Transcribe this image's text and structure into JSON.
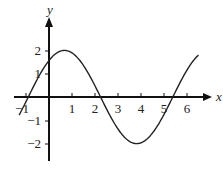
{
  "chart_data": {
    "type": "line",
    "title": "",
    "xlabel": "x",
    "ylabel": "y",
    "xlim": [
      -1.5,
      7
    ],
    "ylim": [
      -2.7,
      3.5
    ],
    "x_ticks": [
      "-1",
      "1",
      "2",
      "3",
      "4",
      "5",
      "6"
    ],
    "y_ticks": [
      "2",
      "1",
      "-1",
      "-2"
    ],
    "grid": false,
    "series": [
      {
        "name": "y = 2 sin(x + 0.9)",
        "function": "2*sin(x+0.9)",
        "x": [
          -1.3,
          -0.9,
          0,
          0.67,
          1,
          2,
          2.24,
          3,
          3.81,
          4,
          5,
          5.38,
          6,
          6.5
        ],
        "values": [
          -0.78,
          0,
          1.57,
          2,
          1.94,
          0.51,
          0,
          -1.46,
          -2,
          -1.97,
          -0.85,
          0,
          1.31,
          1.85
        ]
      }
    ],
    "annotations": {
      "peak": [
        0.67,
        2
      ],
      "trough": [
        3.81,
        -2
      ],
      "zeros": [
        -0.9,
        2.24,
        5.38
      ]
    }
  }
}
